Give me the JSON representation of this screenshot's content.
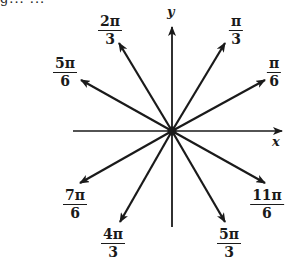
{
  "clipped_header_text": "g...      ...",
  "axes": {
    "x_label": "x",
    "y_label": "y"
  },
  "angles": [
    {
      "id": "pi-over-6",
      "numerator": "π",
      "denominator": "6",
      "tip": [
        265,
        80
      ],
      "label_pos": [
        274,
        56
      ]
    },
    {
      "id": "pi-over-3",
      "numerator": "π",
      "denominator": "3",
      "tip": [
        225,
        43
      ],
      "label_pos": [
        236,
        14
      ]
    },
    {
      "id": "2pi-over-3",
      "numerator": "2π",
      "denominator": "3",
      "tip": [
        119,
        43
      ],
      "label_pos": [
        110,
        14
      ]
    },
    {
      "id": "5pi-over-6",
      "numerator": "5π",
      "denominator": "6",
      "tip": [
        81,
        80
      ],
      "label_pos": [
        65,
        56
      ]
    },
    {
      "id": "7pi-over-6",
      "numerator": "7π",
      "denominator": "6",
      "tip": [
        80,
        183
      ],
      "label_pos": [
        75,
        188
      ]
    },
    {
      "id": "4pi-over-3",
      "numerator": "4π",
      "denominator": "3",
      "tip": [
        120,
        222
      ],
      "label_pos": [
        113,
        227
      ]
    },
    {
      "id": "5pi-over-3",
      "numerator": "5π",
      "denominator": "3",
      "tip": [
        225,
        222
      ],
      "label_pos": [
        229,
        227
      ]
    },
    {
      "id": "11pi-over-6",
      "numerator": "11π",
      "denominator": "6",
      "tip": [
        265,
        183
      ],
      "label_pos": [
        267,
        188
      ]
    }
  ],
  "origin": [
    172,
    131
  ],
  "colors": {
    "ink": "#1a1a1a",
    "background": "#ffffff"
  }
}
